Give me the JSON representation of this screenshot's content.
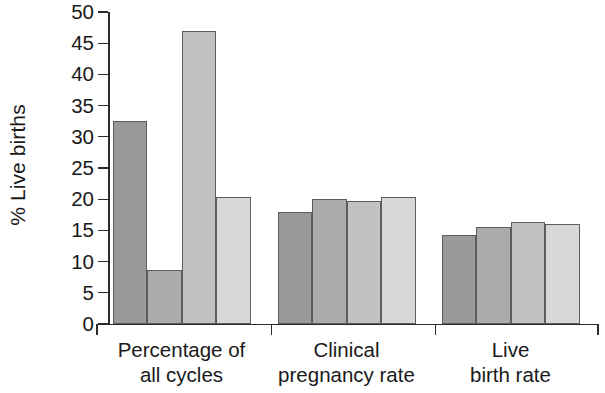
{
  "chart_data": {
    "type": "bar",
    "title": "",
    "xlabel": "",
    "ylabel": "% Live births",
    "ylim": [
      0,
      50
    ],
    "ytick_step": 5,
    "yticks": [
      "50",
      "45",
      "40",
      "35",
      "30",
      "25",
      "20",
      "15",
      "10",
      "5",
      "0"
    ],
    "grid": false,
    "legend": "none",
    "categories": [
      "Percentage of all cycles",
      "Clinical pregnancy rate",
      "Live birth rate"
    ],
    "category_lines": [
      [
        "Percentage of",
        "all cycles"
      ],
      [
        "Clinical",
        "pregnancy rate"
      ],
      [
        "Live",
        "birth rate"
      ]
    ],
    "series": [
      {
        "name": "series-1",
        "color": "#9a9a9a",
        "values": [
          32.5,
          18.0,
          14.2
        ]
      },
      {
        "name": "series-2",
        "color": "#ababab",
        "values": [
          8.7,
          20.1,
          15.5
        ]
      },
      {
        "name": "series-3",
        "color": "#c2c2c2",
        "values": [
          47.0,
          19.7,
          16.4
        ]
      },
      {
        "name": "series-4",
        "color": "#d8d8d8",
        "values": [
          20.3,
          20.4,
          16.0
        ]
      }
    ],
    "bar_outline_color": "#5d5d5d",
    "axis_color": "#2b2b2b",
    "background_color": "#ffffff"
  }
}
